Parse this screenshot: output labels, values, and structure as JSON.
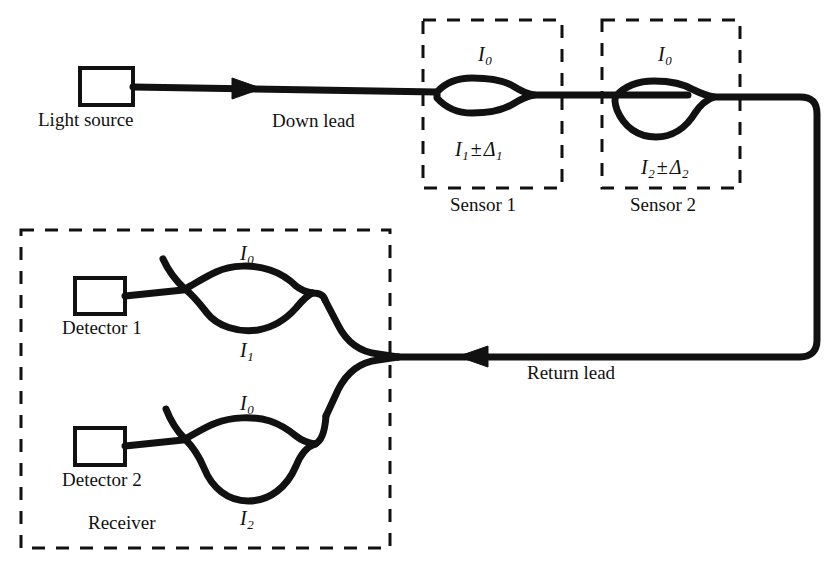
{
  "figure": {
    "type": "optical-fiber-sensor-network-diagram",
    "stroke_color": "#111111",
    "background_color": "#ffffff"
  },
  "source": {
    "box_label": "",
    "caption": "Light source"
  },
  "leads": {
    "down_lead": "Down lead",
    "return_lead": "Return lead"
  },
  "sensors": [
    {
      "caption": "Sensor 1",
      "top_label_base": "I",
      "top_label_sub": "0",
      "bottom_base": "I",
      "bottom_sub": "1",
      "bottom_op": "±",
      "bottom_delta": "Δ",
      "bottom_delta_sub": "1"
    },
    {
      "caption": "Sensor 2",
      "top_label_base": "I",
      "top_label_sub": "0",
      "bottom_base": "I",
      "bottom_sub": "2",
      "bottom_op": "±",
      "bottom_delta": "Δ",
      "bottom_delta_sub": "2"
    }
  ],
  "receiver": {
    "caption": "Receiver",
    "channels": [
      {
        "detector_caption": "Detector 1",
        "top_base": "I",
        "top_sub": "0",
        "bottom_base": "I",
        "bottom_sub": "1"
      },
      {
        "detector_caption": "Detector 2",
        "top_base": "I",
        "top_sub": "0",
        "bottom_base": "I",
        "bottom_sub": "2"
      }
    ]
  }
}
